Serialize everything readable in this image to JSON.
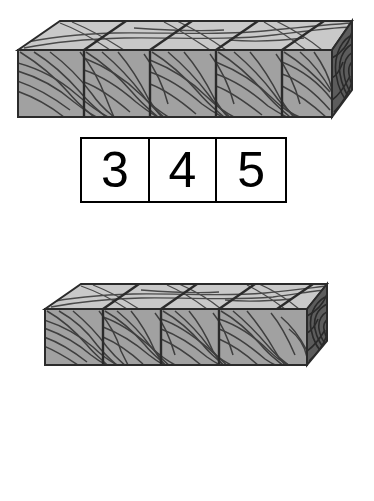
{
  "worksheet": {
    "background_color": "#ffffff",
    "item_count": 2
  },
  "palette": {
    "top_face": "#c9c9c9",
    "front_face": "#a1a1a1",
    "end_face": "#5c5c5c",
    "outline": "#2b2b2b",
    "grain_line": "#4a4a4a",
    "grain_line_dark": "#333333",
    "box_border": "#000000",
    "box_fill": "#ffffff",
    "digit_color": "#000000"
  },
  "items": [
    {
      "id": "item-1",
      "beam": {
        "name": "wooden-beam",
        "segments": 5,
        "has_end_cap": true,
        "end_cap_rings": 5,
        "left": 16,
        "top": 20,
        "width": 337,
        "height": 99
      },
      "answer_row": {
        "name": "answer-boxes",
        "boxes": [
          {
            "value": "3"
          },
          {
            "value": "4"
          },
          {
            "value": "5"
          }
        ]
      }
    },
    {
      "id": "item-2",
      "beam": {
        "name": "wooden-beam",
        "segments": 4,
        "has_end_cap": true,
        "end_cap_rings": 5,
        "left": 43,
        "top": 283,
        "width": 282,
        "height": 83
      },
      "answer_row": {
        "name": "answer-boxes",
        "boxes": [
          {
            "value": "3"
          },
          {
            "value": "4"
          },
          {
            "value": "5"
          }
        ]
      }
    }
  ]
}
